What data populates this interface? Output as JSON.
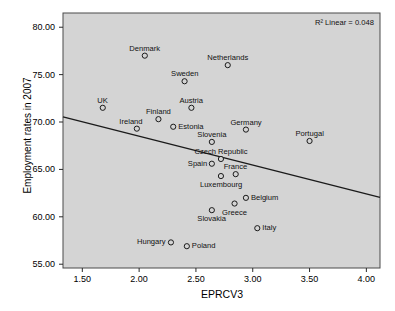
{
  "chart_data": {
    "type": "scatter",
    "title": "",
    "xlabel": "EPRCV3",
    "ylabel": "Employment rates in 2007",
    "xlim": [
      1.33,
      4.12
    ],
    "ylim": [
      54.6,
      81.5
    ],
    "xticks": [
      "1.50",
      "2.00",
      "2.50",
      "3.00",
      "3.50",
      "4.00"
    ],
    "xtick_values": [
      1.5,
      2.0,
      2.5,
      3.0,
      3.5,
      4.0
    ],
    "yticks": [
      "55.00",
      "60.00",
      "65.00",
      "70.00",
      "75.00",
      "80.00"
    ],
    "ytick_values": [
      55,
      60,
      65,
      70,
      75,
      80
    ],
    "grid": false,
    "legend": "none",
    "annotation": "R² Linear = 0.048",
    "plot_background": "#d4d4d4",
    "page_background": "#ffffff",
    "marker_style": "open-circle",
    "marker_color": "#1a1a1a",
    "fit_line": {
      "type": "linear",
      "color": "#1a1a1a",
      "x_start": 1.33,
      "y_start": 70.55,
      "x_end": 4.12,
      "y_end": 62.05
    },
    "points": [
      {
        "name": "Denmark",
        "x": 2.05,
        "y": 77.0,
        "label_pos": "above"
      },
      {
        "name": "Netherlands",
        "x": 2.78,
        "y": 76.0,
        "label_pos": "above"
      },
      {
        "name": "Sweden",
        "x": 2.4,
        "y": 74.3,
        "label_pos": "above"
      },
      {
        "name": "UK",
        "x": 1.68,
        "y": 71.5,
        "label_pos": "above"
      },
      {
        "name": "Austria",
        "x": 2.46,
        "y": 71.5,
        "label_pos": "above"
      },
      {
        "name": "Finland",
        "x": 2.17,
        "y": 70.3,
        "label_pos": "above"
      },
      {
        "name": "Estonia",
        "x": 2.3,
        "y": 69.5,
        "label_pos": "right"
      },
      {
        "name": "Ireland",
        "x": 1.98,
        "y": 69.3,
        "label_pos": "above-left"
      },
      {
        "name": "Germany",
        "x": 2.94,
        "y": 69.2,
        "label_pos": "above"
      },
      {
        "name": "Portugal",
        "x": 3.5,
        "y": 68.0,
        "label_pos": "above"
      },
      {
        "name": "Slovenia",
        "x": 2.64,
        "y": 67.9,
        "label_pos": "above"
      },
      {
        "name": "Czech Republic",
        "x": 2.72,
        "y": 66.1,
        "label_pos": "above"
      },
      {
        "name": "Spain",
        "x": 2.64,
        "y": 65.6,
        "label_pos": "left"
      },
      {
        "name": "France",
        "x": 2.85,
        "y": 64.5,
        "label_pos": "above"
      },
      {
        "name": "Luxembourg",
        "x": 2.72,
        "y": 64.3,
        "label_pos": "below"
      },
      {
        "name": "Belgium",
        "x": 2.94,
        "y": 62.0,
        "label_pos": "right"
      },
      {
        "name": "Greece",
        "x": 2.84,
        "y": 61.4,
        "label_pos": "below"
      },
      {
        "name": "Slovakia",
        "x": 2.64,
        "y": 60.7,
        "label_pos": "below"
      },
      {
        "name": "Italy",
        "x": 3.04,
        "y": 58.8,
        "label_pos": "right"
      },
      {
        "name": "Hungary",
        "x": 2.28,
        "y": 57.3,
        "label_pos": "left"
      },
      {
        "name": "Poland",
        "x": 2.42,
        "y": 56.9,
        "label_pos": "right"
      }
    ]
  }
}
